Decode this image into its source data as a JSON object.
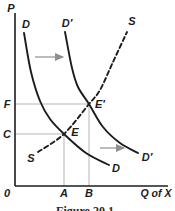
{
  "figure": {
    "caption": "Figure 20.1",
    "background": "#ffffff",
    "ink_color": "#1c1c1c",
    "guide_color": "#b5b5b5",
    "arrow_color": "#8f8f8f"
  },
  "chart_data": {
    "type": "line",
    "title": "",
    "xlabel": "Q of X",
    "ylabel": "P",
    "axes": {
      "origin_label": "0",
      "x_tick_labels": [
        "A",
        "B"
      ],
      "y_tick_labels": [
        "C",
        "F"
      ],
      "y_axis": {
        "x": 15,
        "y1": 13,
        "y2": 186
      },
      "x_axis": {
        "y": 186,
        "x1": 15,
        "x2": 168
      }
    },
    "curves": [
      {
        "name": "demand-d",
        "label": "D",
        "style": "solid",
        "points": [
          [
            24,
            33
          ],
          [
            31,
            72
          ],
          [
            40,
            101
          ],
          [
            50,
            119
          ],
          [
            64,
            134
          ],
          [
            86,
            153
          ],
          [
            109,
            165
          ]
        ]
      },
      {
        "name": "demand-d-prime",
        "label": "D′",
        "style": "solid",
        "points": [
          [
            65,
            32
          ],
          [
            72,
            68
          ],
          [
            78,
            87
          ],
          [
            89,
            104
          ],
          [
            103,
            127
          ],
          [
            120,
            143
          ],
          [
            138,
            153
          ]
        ]
      },
      {
        "name": "supply-s",
        "label": "S",
        "style": "dashed",
        "points": [
          [
            38,
            152
          ],
          [
            64,
            134
          ],
          [
            89,
            104
          ],
          [
            100,
            90
          ],
          [
            113,
            62
          ],
          [
            127,
            32
          ]
        ]
      }
    ],
    "equilibrium_points": [
      {
        "label": "E",
        "x": 64,
        "y": 134,
        "price_label": "C",
        "quantity_label": "A"
      },
      {
        "label": "E′",
        "x": 89,
        "y": 104,
        "price_label": "F",
        "quantity_label": "B"
      }
    ],
    "guide_lines": [
      {
        "name": "price-f-line",
        "x1": 15,
        "y1": 104,
        "x2": 89,
        "y2": 104
      },
      {
        "name": "price-c-line",
        "x1": 15,
        "y1": 134,
        "x2": 64,
        "y2": 134
      },
      {
        "name": "quantity-a-line",
        "x1": 64,
        "y1": 134,
        "x2": 64,
        "y2": 186
      },
      {
        "name": "quantity-b-line",
        "x1": 89,
        "y1": 104,
        "x2": 89,
        "y2": 186
      }
    ],
    "shift_arrows": [
      {
        "name": "upper-shift-arrow",
        "x1": 35,
        "y1": 57,
        "x2": 63,
        "y2": 57
      },
      {
        "name": "lower-shift-arrow",
        "x1": 100,
        "y1": 148,
        "x2": 124,
        "y2": 148
      }
    ]
  },
  "labels": [
    {
      "name": "p-axis-label",
      "text": "P",
      "x": 11,
      "y": 8
    },
    {
      "name": "curve-label-d-top",
      "text": "D",
      "x": 26,
      "y": 24
    },
    {
      "name": "curve-label-d-prime-top",
      "text": "D′",
      "x": 67,
      "y": 23
    },
    {
      "name": "curve-label-s-top",
      "text": "S",
      "x": 132,
      "y": 21
    },
    {
      "name": "price-label-f",
      "text": "F",
      "x": 7,
      "y": 104
    },
    {
      "name": "price-label-c",
      "text": "C",
      "x": 7,
      "y": 134
    },
    {
      "name": "point-label-e-prime",
      "text": "E′",
      "x": 100,
      "y": 104
    },
    {
      "name": "point-label-e",
      "text": "E",
      "x": 75,
      "y": 132
    },
    {
      "name": "curve-label-s-bottom",
      "text": "S",
      "x": 31,
      "y": 158
    },
    {
      "name": "curve-label-d-prime-right",
      "text": "D′",
      "x": 147,
      "y": 157
    },
    {
      "name": "curve-label-d-right",
      "text": "D",
      "x": 116,
      "y": 168
    },
    {
      "name": "origin-label",
      "text": "0",
      "x": 7,
      "y": 193
    },
    {
      "name": "quantity-label-a",
      "text": "A",
      "x": 64,
      "y": 193
    },
    {
      "name": "quantity-label-b",
      "text": "B",
      "x": 89,
      "y": 193
    },
    {
      "name": "x-axis-label",
      "text": "Q of X",
      "x": 156,
      "y": 193
    }
  ]
}
